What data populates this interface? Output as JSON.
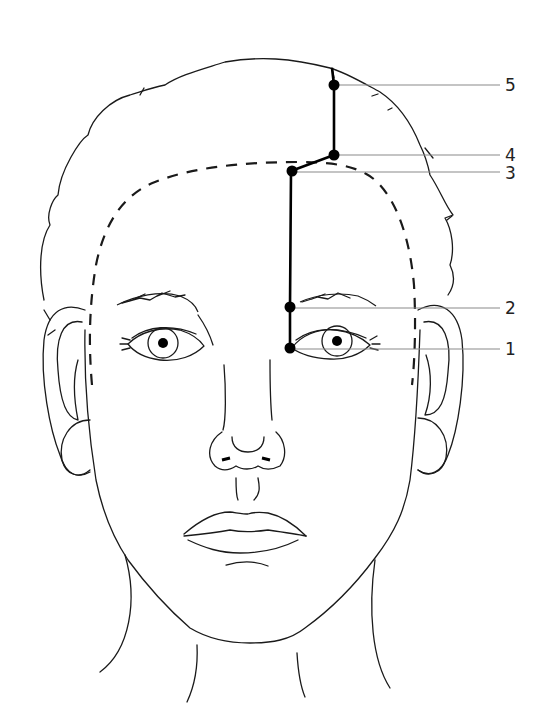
{
  "diagram": {
    "colors": {
      "ink": "#1a1a1a",
      "point": "#000000",
      "leader": "#8a8a8a",
      "label": "#222222"
    },
    "points": [
      {
        "id": "1",
        "label": "1",
        "x": 290,
        "y": 348,
        "label_y": 350
      },
      {
        "id": "2",
        "label": "2",
        "x": 290,
        "y": 307,
        "label_y": 309
      },
      {
        "id": "3",
        "label": "3",
        "x": 292,
        "y": 171,
        "label_y": 174
      },
      {
        "id": "4",
        "label": "4",
        "x": 334,
        "y": 155,
        "label_y": 157
      },
      {
        "id": "5",
        "label": "5",
        "x": 334,
        "y": 85,
        "label_y": 86
      }
    ],
    "leader_end_x": 500,
    "label_x": 505
  }
}
